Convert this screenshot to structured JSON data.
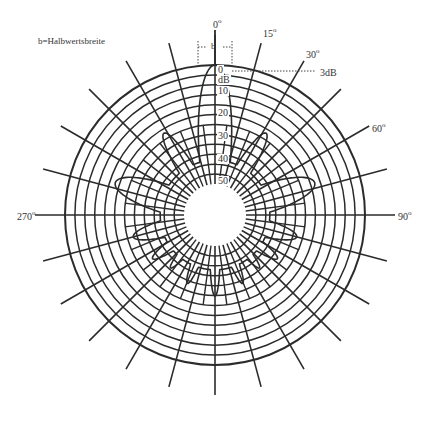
{
  "legend": {
    "text": "b=Halbwertsbreite"
  },
  "beamwidth_marker": {
    "label": "b"
  },
  "threshold_marker": {
    "label": "3dB"
  },
  "angle_labels": [
    {
      "deg": "0",
      "text": "0",
      "sup": "o"
    },
    {
      "deg": "15",
      "text": "15",
      "sup": "o"
    },
    {
      "deg": "30",
      "text": "30",
      "sup": "o"
    },
    {
      "deg": "60",
      "text": "60",
      "sup": "o"
    },
    {
      "deg": "90",
      "text": "90",
      "sup": "o"
    },
    {
      "deg": "270",
      "text": "270",
      "sup": "o"
    }
  ],
  "db_scale": {
    "unit": "dB",
    "ticks": [
      "0",
      "10",
      "20",
      "30",
      "40",
      "50"
    ]
  },
  "grid": {
    "rings": 12,
    "spoke_step_deg": 15,
    "color": "#2b2b2b"
  },
  "pattern": {
    "main_lobe_deg": 0,
    "side_lobes_deg": [
      -60,
      -30,
      30,
      60,
      -100,
      100,
      -130,
      -145,
      -160,
      160,
      145,
      130,
      180
    ],
    "color": "#2b2b2b"
  }
}
